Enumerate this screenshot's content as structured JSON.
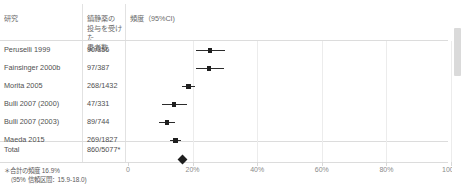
{
  "table": {
    "headers": {
      "study": "研究",
      "patients": "鎮静薬の\n投与を受けた\n患者数",
      "frequency": "頻度（95%CI)"
    },
    "rows": [
      {
        "study": "Peruselli 1999",
        "count": "90/356"
      },
      {
        "study": "Fainsinger 2000b",
        "count": "97/387"
      },
      {
        "study": "Morita  2005",
        "count": "268/1432"
      },
      {
        "study": "Bulli 2007 (2000)",
        "count": "47/331"
      },
      {
        "study": "Bulli 2007 (2003)",
        "count": "89/744"
      },
      {
        "study": "Maeda 2015",
        "count": "269/1827"
      }
    ],
    "total": {
      "study": "Total",
      "count": "860/5077*"
    }
  },
  "footnote": "＊合計の頻度 16.9%\n　（95% 信頼区間：15.9-18.0)",
  "chart_data": {
    "type": "forest",
    "title": "",
    "xlabel": "",
    "ylabel": "",
    "xlim": [
      0,
      100
    ],
    "grid": true,
    "tick_labels": [
      "0",
      "20%",
      "40%",
      "60%",
      "80%",
      "100%"
    ],
    "tick_values": [
      0,
      20,
      40,
      60,
      80,
      100
    ],
    "studies": [
      {
        "name": "Peruselli 1999",
        "events": 90,
        "total": 356,
        "estimate": 25.3,
        "ci_low": 20.9,
        "ci_high": 30.1
      },
      {
        "name": "Fainsinger 2000b",
        "events": 97,
        "total": 387,
        "estimate": 25.1,
        "ci_low": 20.9,
        "ci_high": 29.7
      },
      {
        "name": "Morita 2005",
        "events": 268,
        "total": 1432,
        "estimate": 18.7,
        "ci_low": 16.7,
        "ci_high": 20.8
      },
      {
        "name": "Bulli 2007 (2000)",
        "events": 47,
        "total": 331,
        "estimate": 14.2,
        "ci_low": 10.6,
        "ci_high": 18.4
      },
      {
        "name": "Bulli 2007 (2003)",
        "events": 89,
        "total": 744,
        "estimate": 12.0,
        "ci_low": 9.7,
        "ci_high": 14.6
      },
      {
        "name": "Maeda 2015",
        "events": 269,
        "total": 1827,
        "estimate": 14.7,
        "ci_low": 13.1,
        "ci_high": 16.4
      }
    ],
    "summary": {
      "name": "Total",
      "events": 860,
      "total": 5077,
      "estimate": 16.9,
      "ci_low": 15.9,
      "ci_high": 18.0
    }
  },
  "scrollbar": {
    "orientation": "vertical"
  }
}
